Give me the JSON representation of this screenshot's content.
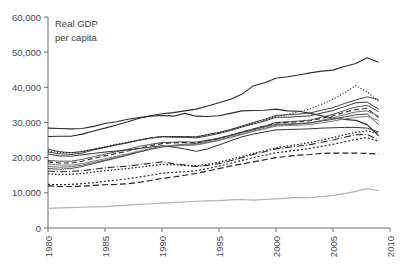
{
  "chart_data": {
    "type": "line",
    "title": "",
    "annotation": "Real GDP\nper capita",
    "annotation_line1": "Real GDP",
    "annotation_line2": "per capita",
    "xlabel": "",
    "ylabel": "",
    "grid": false,
    "legend": "none",
    "xlim": [
      1980,
      2010
    ],
    "ylim": [
      0,
      60000
    ],
    "yticks": [
      0,
      10000,
      20000,
      30000,
      40000,
      50000,
      60000
    ],
    "ytick_labels": [
      "0",
      "10,000",
      "20,000",
      "30,000",
      "40,000",
      "50,000",
      "60,000"
    ],
    "xticks": [
      1980,
      1985,
      1990,
      1995,
      2000,
      2005,
      2010
    ],
    "xtick_labels": [
      "1980",
      "1985",
      "1990",
      "1995",
      "2000",
      "2005",
      "2010"
    ],
    "x": [
      1980,
      1981,
      1982,
      1983,
      1984,
      1985,
      1986,
      1987,
      1988,
      1989,
      1990,
      1991,
      1992,
      1993,
      1994,
      1995,
      1996,
      1997,
      1998,
      1999,
      2000,
      2001,
      2002,
      2003,
      2004,
      2005,
      2006,
      2007,
      2008,
      2009
    ],
    "series": [
      {
        "name": "series-1",
        "style": "solid",
        "color": "#2b2b2b",
        "width": 1.1,
        "values": [
          28400,
          28300,
          28200,
          28300,
          28900,
          29700,
          30200,
          30900,
          31400,
          31800,
          32000,
          31800,
          32600,
          31800,
          31700,
          31900,
          32600,
          33300,
          33400,
          33500,
          33800,
          33300,
          33200,
          32600,
          31900,
          31300,
          30900,
          30600,
          29400,
          26200
        ]
      },
      {
        "name": "series-2",
        "style": "solid",
        "color": "#2b2b2b",
        "width": 1.1,
        "values": [
          26000,
          26100,
          26100,
          26700,
          27600,
          28400,
          29300,
          30200,
          31200,
          31900,
          32500,
          32800,
          33300,
          33800,
          34700,
          35600,
          36600,
          38000,
          40400,
          41300,
          42600,
          43000,
          43500,
          44100,
          44600,
          44900,
          45900,
          46800,
          48400,
          47100
        ]
      },
      {
        "name": "series-3",
        "style": "solid",
        "color": "#3a3a3a",
        "width": 1.0,
        "values": [
          22400,
          21700,
          21400,
          21700,
          22400,
          23000,
          23700,
          24300,
          25000,
          25600,
          26000,
          25800,
          25800,
          25600,
          26200,
          26900,
          27700,
          28700,
          29600,
          30400,
          31500,
          31500,
          31700,
          31900,
          32700,
          33400,
          34500,
          35600,
          35800,
          33800
        ]
      },
      {
        "name": "series-4",
        "style": "solid",
        "color": "#444444",
        "width": 1.0,
        "values": [
          21600,
          21100,
          20900,
          21300,
          22200,
          22900,
          23600,
          24200,
          25000,
          25600,
          26000,
          26000,
          26000,
          25900,
          26600,
          27200,
          28000,
          29000,
          30000,
          30900,
          32000,
          32200,
          32400,
          32700,
          33500,
          34200,
          35400,
          36400,
          37300,
          36500
        ]
      },
      {
        "name": "series-5",
        "style": "dotted",
        "color": "#1f1f1f",
        "width": 1.2,
        "dash": "1,2",
        "values": [
          21900,
          21500,
          21400,
          21800,
          22400,
          23100,
          23800,
          24400,
          25000,
          25500,
          25900,
          26000,
          26000,
          25900,
          26500,
          27100,
          27900,
          28800,
          29700,
          30700,
          31700,
          32300,
          33100,
          33900,
          35200,
          36600,
          38400,
          40500,
          38700,
          36000
        ]
      },
      {
        "name": "series-6",
        "style": "solid",
        "color": "#555555",
        "width": 1.0,
        "values": [
          19200,
          19000,
          19000,
          19500,
          20300,
          21000,
          21700,
          22400,
          23200,
          23800,
          24300,
          24400,
          24500,
          24400,
          25000,
          25600,
          26400,
          27300,
          28200,
          29000,
          30000,
          30200,
          30400,
          30700,
          31500,
          32300,
          33400,
          34400,
          34900,
          33000
        ]
      },
      {
        "name": "series-7",
        "style": "dashed",
        "color": "#2b2b2b",
        "width": 1.1,
        "dash": "5,3",
        "values": [
          18800,
          18500,
          18500,
          19000,
          19800,
          20500,
          21200,
          21900,
          22700,
          23400,
          24000,
          24200,
          24300,
          24200,
          24800,
          25500,
          26300,
          27200,
          28100,
          28900,
          29900,
          30100,
          30200,
          30500,
          31200,
          31900,
          32900,
          33700,
          34000,
          31400
        ]
      },
      {
        "name": "series-8",
        "style": "solid",
        "color": "#6a6a6a",
        "width": 1.0,
        "values": [
          17500,
          17300,
          17400,
          17900,
          18600,
          19300,
          20100,
          20900,
          21700,
          22400,
          23000,
          23300,
          23500,
          23600,
          24200,
          24900,
          25700,
          26600,
          27500,
          28300,
          29200,
          29400,
          29600,
          29900,
          30600,
          31300,
          32200,
          33000,
          33300,
          31800
        ]
      },
      {
        "name": "series-9",
        "style": "solid",
        "color": "#4a4a4a",
        "width": 1.0,
        "values": [
          16900,
          16700,
          16900,
          17500,
          18300,
          19100,
          19900,
          20700,
          21600,
          22400,
          23100,
          23500,
          23800,
          24000,
          24700,
          25400,
          26200,
          27100,
          27900,
          28700,
          29500,
          29600,
          29700,
          29900,
          30400,
          30900,
          31600,
          32200,
          32400,
          29400
        ]
      },
      {
        "name": "series-10",
        "style": "solid",
        "color": "#333333",
        "width": 1.0,
        "values": [
          21000,
          20500,
          20400,
          20800,
          21200,
          21600,
          21900,
          22200,
          22600,
          23000,
          23400,
          23000,
          22500,
          21800,
          22500,
          23600,
          24800,
          25900,
          26700,
          27300,
          27900,
          28000,
          28100,
          28200,
          28400,
          28500,
          28600,
          28600,
          28400,
          27300
        ]
      },
      {
        "name": "series-11",
        "style": "dashdot",
        "color": "#2b2b2b",
        "width": 1.1,
        "dash": "7,2,1,2",
        "values": [
          16200,
          16000,
          16100,
          16300,
          16700,
          17100,
          17400,
          17600,
          18000,
          18400,
          18800,
          18300,
          17900,
          17500,
          17800,
          18300,
          19100,
          20000,
          20900,
          21700,
          22500,
          22900,
          23300,
          23700,
          24400,
          25000,
          25800,
          26500,
          26600,
          25000
        ]
      },
      {
        "name": "series-12",
        "style": "dotted",
        "color": "#1f1f1f",
        "width": 1.3,
        "dash": "1.5,2",
        "values": [
          15400,
          15200,
          15300,
          15500,
          15900,
          16300,
          16600,
          16900,
          17300,
          17700,
          18100,
          18000,
          17800,
          17700,
          18100,
          18700,
          19500,
          20300,
          21200,
          22000,
          22800,
          23300,
          23800,
          24300,
          25000,
          25700,
          26500,
          27200,
          27600,
          26900
        ]
      },
      {
        "name": "series-13",
        "style": "dotted",
        "color": "#2b2b2b",
        "width": 1.2,
        "dash": "2,2",
        "values": [
          12400,
          12300,
          12400,
          12600,
          12900,
          13300,
          13600,
          14000,
          14500,
          15000,
          15600,
          15800,
          16000,
          16300,
          16900,
          17600,
          18400,
          19200,
          20000,
          20700,
          21400,
          21800,
          22200,
          22600,
          23200,
          23800,
          24500,
          25200,
          25700,
          24600
        ]
      },
      {
        "name": "series-14",
        "style": "dashed",
        "color": "#1f1f1f",
        "width": 1.2,
        "dash": "6,3",
        "values": [
          12000,
          11800,
          11800,
          11900,
          12100,
          12300,
          12400,
          12600,
          13000,
          13500,
          14100,
          14500,
          15000,
          15500,
          16200,
          16900,
          17600,
          18200,
          18800,
          19400,
          20000,
          20400,
          20700,
          20900,
          21200,
          21300,
          21300,
          21300,
          21200,
          21000
        ]
      },
      {
        "name": "series-15",
        "style": "solid",
        "color": "#7d7d7d",
        "width": 1.0,
        "values": [
          18200,
          17900,
          17900,
          18300,
          19000,
          19700,
          20400,
          21100,
          21900,
          22600,
          23200,
          23500,
          23700,
          23800,
          24400,
          25100,
          25900,
          26700,
          27500,
          28200,
          29000,
          29100,
          29200,
          29400,
          29900,
          30400,
          31000,
          31500,
          31700,
          30600
        ]
      },
      {
        "name": "series-16",
        "style": "solid",
        "color": "#b0b0b0",
        "width": 1.2,
        "values": [
          5600,
          5700,
          5800,
          5900,
          6000,
          6100,
          6300,
          6500,
          6700,
          6900,
          7100,
          7200,
          7400,
          7600,
          7700,
          7800,
          8000,
          8100,
          7900,
          8100,
          8300,
          8500,
          8700,
          8600,
          8900,
          9300,
          9800,
          10400,
          11200,
          10600
        ]
      }
    ]
  },
  "axes": {
    "y_tick_labels": [
      "60,000",
      "50,000",
      "40,000",
      "30,000",
      "20,000",
      "10,000",
      "0"
    ],
    "x_tick_labels": [
      "1980",
      "1985",
      "1990",
      "1995",
      "2000",
      "2005",
      "2010"
    ]
  }
}
